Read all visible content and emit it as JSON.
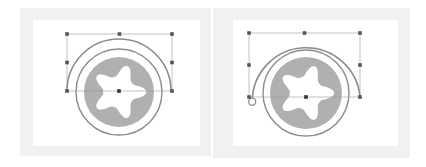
{
  "colors": {
    "frame": "#f1f1f1",
    "canvas": "#ffffff",
    "stroke": "#8c8c8c",
    "disc": "#b0b0b0",
    "bbox": "#9a9a9a",
    "handle": "#555555"
  },
  "panels": [
    {
      "name": "before",
      "frame": {
        "x": 20,
        "y": 8,
        "w": 191,
        "h": 148
      },
      "inner": {
        "x": 33,
        "y": 20,
        "w": 167,
        "h": 126
      },
      "center": {
        "x": 119,
        "y": 91
      },
      "arc": {
        "r": 52,
        "start_deg": 180,
        "end_deg": 0,
        "end_marker": false
      },
      "ring_r": 43,
      "ring_cy_offset": 1,
      "disc_r": 35,
      "bbox": {
        "x1": 67,
        "y1": 34,
        "x2": 172,
        "y2": 91
      }
    },
    {
      "name": "after",
      "frame": {
        "x": 213,
        "y": 8,
        "w": 197,
        "h": 150
      },
      "inner": {
        "x": 233,
        "y": 20,
        "w": 165,
        "h": 126
      },
      "center": {
        "x": 306,
        "y": 97
      },
      "arc": {
        "r": 54,
        "start_deg": 185,
        "end_deg": 0,
        "end_marker": true
      },
      "ring_r": 43,
      "ring_cy_offset": -4,
      "disc_r": 36,
      "bbox": {
        "x1": 249,
        "y1": 33,
        "x2": 360,
        "y2": 97
      }
    }
  ]
}
